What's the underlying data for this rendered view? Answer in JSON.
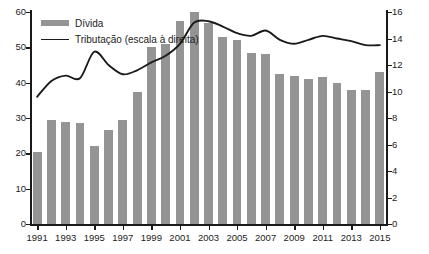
{
  "chart_data": {
    "type": "bar",
    "title": "",
    "xlabel": "",
    "ylabel": "",
    "grid": false,
    "legend_position": "top-left",
    "x": [
      1991,
      1992,
      1993,
      1994,
      1995,
      1996,
      1997,
      1998,
      1999,
      2000,
      2001,
      2002,
      2003,
      2004,
      2005,
      2006,
      2007,
      2008,
      2009,
      2010,
      2011,
      2012,
      2013,
      2014,
      2015
    ],
    "categories": [
      "1991",
      "1992",
      "1993",
      "1994",
      "1995",
      "1996",
      "1997",
      "1998",
      "1999",
      "2000",
      "2001",
      "2002",
      "2003",
      "2004",
      "2005",
      "2006",
      "2007",
      "2008",
      "2009",
      "2010",
      "2011",
      "2012",
      "2013",
      "2014",
      "2015"
    ],
    "xtick_labels": [
      "1991",
      "1993",
      "1995",
      "1997",
      "1999",
      "2001",
      "2003",
      "2005",
      "2007",
      "2009",
      "2011",
      "2013",
      "2015"
    ],
    "left_axis": {
      "ylim": [
        0,
        60
      ],
      "ticks": [
        "0",
        "10",
        "20",
        "30",
        "40",
        "50",
        "60"
      ],
      "tick_values": [
        0,
        10,
        20,
        30,
        40,
        50,
        60
      ]
    },
    "right_axis": {
      "ylim": [
        0,
        16
      ],
      "ticks": [
        "0",
        "2",
        "4",
        "6",
        "8",
        "10",
        "12",
        "14",
        "16"
      ],
      "tick_values": [
        0,
        2,
        4,
        6,
        8,
        10,
        12,
        14,
        16
      ]
    },
    "series": [
      {
        "name": "Dívida",
        "type": "bar",
        "axis": "left",
        "color": "#949494",
        "values": [
          20.5,
          29.5,
          28.8,
          28.5,
          22.0,
          26.5,
          29.5,
          37.5,
          50.0,
          51.0,
          57.5,
          60.0,
          57.0,
          53.0,
          52.0,
          48.5,
          48.0,
          42.5,
          42.0,
          41.0,
          41.5,
          40.0,
          38.0,
          38.0,
          43.0
        ]
      },
      {
        "name": "Tributação (escala à direita)",
        "type": "line",
        "axis": "right",
        "color": "#1a1a1a",
        "values": [
          9.6,
          10.8,
          11.2,
          11.0,
          13.0,
          12.0,
          11.3,
          11.6,
          12.2,
          12.7,
          13.6,
          15.2,
          15.3,
          14.9,
          14.4,
          14.2,
          14.6,
          13.9,
          13.6,
          13.9,
          14.2,
          14.0,
          13.8,
          13.5,
          13.5
        ]
      }
    ]
  },
  "legend": {
    "items": [
      {
        "label": "Dívida",
        "marker": "bar-swatch"
      },
      {
        "label": "Tributação (escala à direita)",
        "marker": "line-swatch"
      }
    ]
  }
}
